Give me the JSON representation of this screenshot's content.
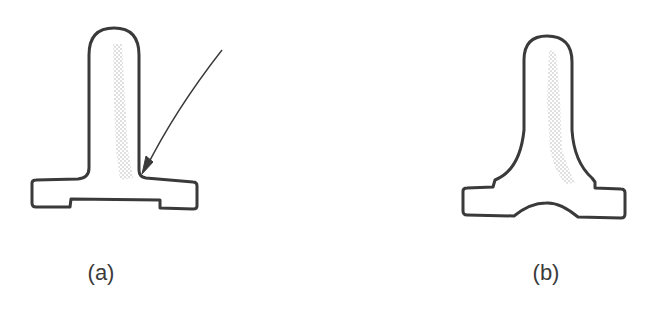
{
  "figures": [
    {
      "id": "a",
      "label": "(a)",
      "description": "T-shaped part with straight stem and sharp fillet; arrow points to stress-concentrating corner"
    },
    {
      "id": "b",
      "label": "(b)",
      "description": "T-shaped part with generously radiused fillets and arched base recess"
    }
  ],
  "colors": {
    "outline": "#3a3a3a",
    "stipple": "#b8b8b8",
    "background": "#ffffff"
  }
}
